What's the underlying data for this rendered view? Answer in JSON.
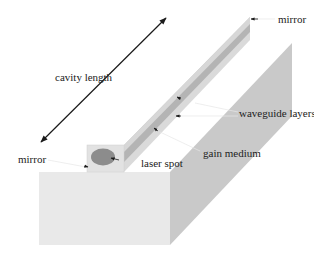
{
  "figure": {
    "labels": {
      "mirror_back": "mirror",
      "mirror_front": "mirror",
      "cavity_length": "cavity length",
      "waveguide_layers": "waveguide layers",
      "gain_medium": "gain medium",
      "laser_spot": "laser spot"
    },
    "colors": {
      "background": "#ffffff",
      "block_front": "#e9e9e9",
      "block_side": "#c9c9c9",
      "ridge_front": "#e4e4e4",
      "ridge_top": "#d4d4d4",
      "ridge_stripe": "#b9b9b9",
      "laser_spot": "#8c8c8c",
      "arrow": "#1a1a1a"
    }
  }
}
